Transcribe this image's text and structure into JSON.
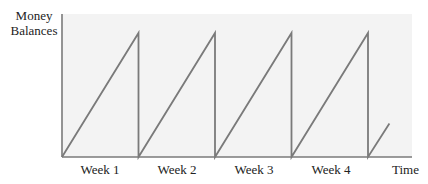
{
  "chart_data": {
    "type": "line",
    "title": "",
    "xlabel": "Time",
    "ylabel": "Money Balances",
    "categories": [
      "Week 1",
      "Week 2",
      "Week 3",
      "Week 4"
    ],
    "series": [
      {
        "name": "Money Balances",
        "points": [
          {
            "x": 0,
            "y": 0
          },
          {
            "x": 1,
            "y": 1
          },
          {
            "x": 1,
            "y": 0
          },
          {
            "x": 2,
            "y": 1
          },
          {
            "x": 2,
            "y": 0
          },
          {
            "x": 3,
            "y": 1
          },
          {
            "x": 3,
            "y": 0
          },
          {
            "x": 4,
            "y": 1
          },
          {
            "x": 4,
            "y": 0
          },
          {
            "x": 4.28,
            "y": 0.27
          }
        ]
      }
    ],
    "xlim": [
      0,
      4.6
    ],
    "ylim": [
      0,
      1.2
    ],
    "grid": false,
    "legend": null
  },
  "labels": {
    "ylabel_line1": "Money",
    "ylabel_line2": "Balances",
    "xlabel": "Time",
    "weeks": [
      "Week 1",
      "Week 2",
      "Week 3",
      "Week 4"
    ]
  },
  "colors": {
    "line": "#7a7a7a",
    "plot_bg": "#f3f3f3",
    "axis": "#7a7a7a",
    "text": "#222222"
  }
}
